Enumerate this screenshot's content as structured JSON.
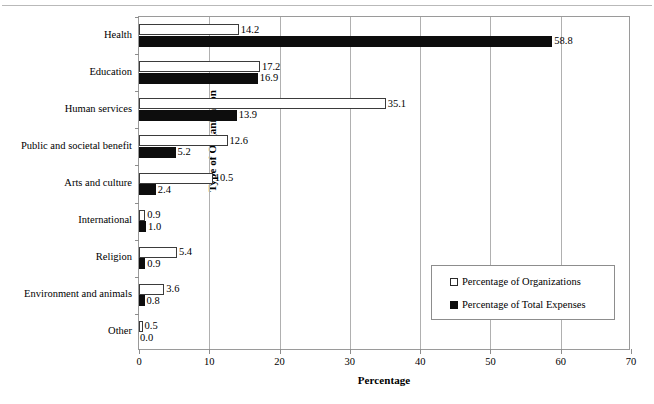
{
  "chart_data": {
    "type": "bar",
    "orientation": "horizontal",
    "title": "",
    "xlabel": "Percentage",
    "ylabel": "Type of Organization",
    "xlim": [
      0,
      70
    ],
    "xticks": [
      0,
      10,
      20,
      30,
      40,
      50,
      60,
      70
    ],
    "grid": true,
    "legend_position": "center-right-inside",
    "categories": [
      "Health",
      "Education",
      "Human services",
      "Public and societal benefit",
      "Arts and culture",
      "International",
      "Religion",
      "Environment and animals",
      "Other"
    ],
    "series": [
      {
        "name": "Percentage of Organizations",
        "style": "white-bar",
        "color": "#ffffff",
        "edge_color": "#000000",
        "values": [
          14.2,
          17.2,
          35.1,
          12.6,
          10.5,
          0.9,
          5.4,
          3.6,
          0.5
        ],
        "labels": [
          "14.2",
          "17.2",
          "35.1",
          "12.6",
          "10.5",
          "0.9",
          "5.4",
          "3.6",
          "0.5"
        ]
      },
      {
        "name": "Percentage of Total Expenses",
        "style": "black-bar",
        "color": "#000000",
        "edge_color": "#000000",
        "values": [
          58.8,
          16.9,
          13.9,
          5.2,
          2.4,
          1.0,
          0.9,
          0.8,
          0.0
        ],
        "labels": [
          "58.8",
          "16.9",
          "13.9",
          "5.2",
          "2.4",
          "1.0",
          "0.9",
          "0.8",
          "0.0"
        ]
      }
    ]
  },
  "legend": {
    "entries": [
      {
        "label": "Percentage of Organizations"
      },
      {
        "label": "Percentage of Total Expenses"
      }
    ]
  }
}
